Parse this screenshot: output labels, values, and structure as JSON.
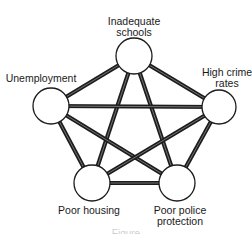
{
  "diagram": {
    "type": "complete-graph",
    "nodes": [
      {
        "id": "schools",
        "label_lines": [
          "Inadequate",
          "schools"
        ],
        "cx": 134,
        "cy": 56,
        "r": 18
      },
      {
        "id": "unemployment",
        "label_lines": [
          "Unemployment"
        ],
        "cx": 51,
        "cy": 106,
        "r": 18
      },
      {
        "id": "crime",
        "label_lines": [
          "High crime",
          "rates"
        ],
        "cx": 219,
        "cy": 107,
        "r": 17
      },
      {
        "id": "housing",
        "label_lines": [
          "Poor housing"
        ],
        "cx": 92,
        "cy": 183,
        "r": 18
      },
      {
        "id": "police",
        "label_lines": [
          "Poor police",
          "protection"
        ],
        "cx": 177,
        "cy": 183,
        "r": 18
      }
    ],
    "edges": [
      [
        "schools",
        "unemployment"
      ],
      [
        "schools",
        "crime"
      ],
      [
        "schools",
        "housing"
      ],
      [
        "schools",
        "police"
      ],
      [
        "unemployment",
        "crime"
      ],
      [
        "unemployment",
        "housing"
      ],
      [
        "unemployment",
        "police"
      ],
      [
        "crime",
        "housing"
      ],
      [
        "crime",
        "police"
      ],
      [
        "housing",
        "police"
      ]
    ],
    "colors": {
      "edge": "#1c1c1c",
      "edge_inner": "#8a8a8a",
      "node_stroke": "#1c1c1c",
      "node_fill": "#ffffff"
    },
    "caption": "Figure"
  },
  "labels": {
    "schools_1": "Inadequate",
    "schools_2": "schools",
    "unemployment": "Unemployment",
    "crime_1": "High crime",
    "crime_2": "rates",
    "housing": "Poor housing",
    "police_1": "Poor police",
    "police_2": "protection",
    "caption": "Figure"
  }
}
